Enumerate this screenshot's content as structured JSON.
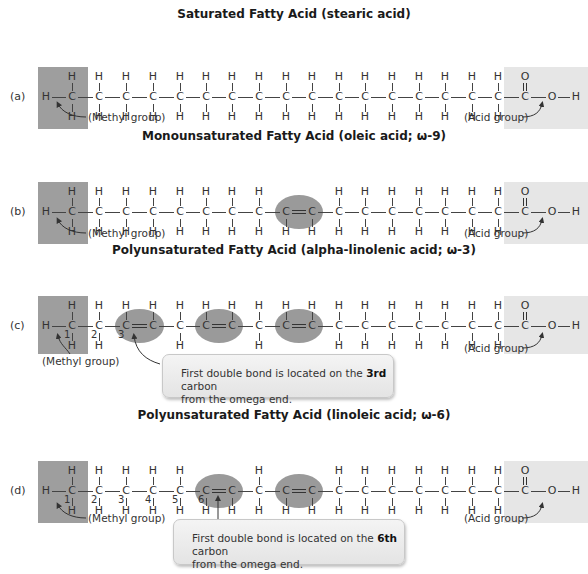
{
  "colors": {
    "methyl_box": "#9e9e9e",
    "acid_box": "#e6e6e6",
    "double_bond_highlight": "#9a9a9a",
    "callout_bg": "#ececec",
    "text": "#333333"
  },
  "layout": {
    "carbon_x": [
      72,
      99,
      126,
      153,
      180,
      206,
      232,
      259,
      286,
      312,
      339,
      365,
      392,
      419,
      445,
      472,
      498,
      525
    ],
    "oxygen_x": 552,
    "end_h_x": 576
  },
  "panels": [
    {
      "id": "a",
      "label": "(a)",
      "title": "Saturated Fatty Acid (stearic acid)",
      "center_y": 97,
      "double_bonds_after_carbon": [],
      "missing_top_h": [],
      "missing_bottom_h": [],
      "carbon_numbers": [],
      "methyl_label": "(Methyl group)",
      "acid_label": "(Acid group)",
      "callout": null
    },
    {
      "id": "b",
      "label": "(b)",
      "title": "Monounsaturated Fatty Acid (oleic acid; ω-9)",
      "center_y": 212,
      "double_bonds_after_carbon": [
        8
      ],
      "missing_top_h": [
        8,
        9
      ],
      "missing_bottom_h": [],
      "carbon_numbers": [],
      "methyl_label": "(Methyl group)",
      "acid_label": "(Acid group)",
      "callout": null
    },
    {
      "id": "c",
      "label": "(c)",
      "title": "Polyunsaturated Fatty Acid (alpha-linolenic acid; ω-3)",
      "center_y": 326,
      "double_bonds_after_carbon": [
        2,
        5,
        8
      ],
      "missing_top_h": [],
      "missing_bottom_h": [
        2,
        3,
        5,
        6,
        8,
        9
      ],
      "carbon_numbers": [
        "1",
        "2",
        "3"
      ],
      "methyl_label": "(Methyl group)",
      "acid_label": "(Acid group)",
      "callout": {
        "line1_pre": "First double bond is located on the ",
        "line1_bold": "3rd",
        "line1_post": " carbon",
        "line2": "from the omega end."
      }
    },
    {
      "id": "d",
      "label": "(d)",
      "title": "Polyunsaturated Fatty Acid (linoleic acid; ω-6)",
      "center_y": 491,
      "double_bonds_after_carbon": [
        5,
        8
      ],
      "missing_top_h": [
        5,
        6,
        8,
        9
      ],
      "missing_bottom_h": [],
      "carbon_numbers": [
        "1",
        "2",
        "3",
        "4",
        "5",
        "6"
      ],
      "methyl_label": "(Methyl group)",
      "acid_label": "(Acid group)",
      "callout": {
        "line1_pre": "First double bond is located on the ",
        "line1_bold": "6th",
        "line1_post": " carbon",
        "line2": "from the omega end."
      }
    }
  ],
  "atoms": {
    "carbon": "C",
    "hydrogen": "H",
    "oxygen": "O"
  }
}
